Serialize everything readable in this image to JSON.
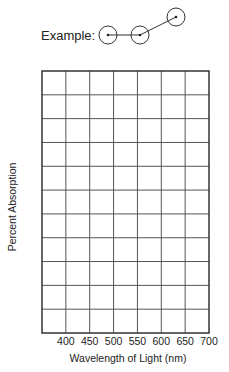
{
  "example": {
    "label": "Example:",
    "points": [
      {
        "cx": 108,
        "cy": 35
      },
      {
        "cx": 140,
        "cy": 35
      },
      {
        "cx": 176,
        "cy": 17
      }
    ],
    "radius": 9
  },
  "chart_data": {
    "type": "line",
    "title": "",
    "xlabel": "Wavelength of Light (nm)",
    "ylabel": "Percent Absorption",
    "x_ticks": [
      "400",
      "450",
      "500",
      "550",
      "600",
      "650",
      "700"
    ],
    "y_ticks": [],
    "xlim": [
      350,
      700
    ],
    "grid": true,
    "grid_columns": 7,
    "grid_rows": 11,
    "series": [],
    "legend": null,
    "note": "Blank graph grid for plotting; example shows circled data points connected by lines"
  },
  "colors": {
    "grid": "#555555",
    "frame": "#333333",
    "text": "#222222"
  }
}
